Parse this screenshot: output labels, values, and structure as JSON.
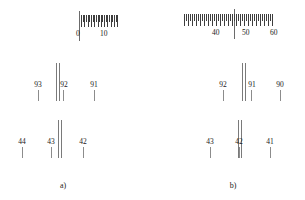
{
  "figure": {
    "groups": [
      {
        "caption": "a)",
        "scale": {
          "labels": [
            {
              "text": "0",
              "x": 62
            },
            {
              "text": "10",
              "x": 88
            }
          ],
          "divider_x": 62,
          "tick_start": 64,
          "tick_count": 23,
          "tick_spacing": 1.65
        },
        "mid": {
          "index_lines": [
            46,
            48.5
          ],
          "readings": [
            {
              "text": "93",
              "x": 28
            },
            {
              "text": "92",
              "x": 53
            },
            {
              "text": "91",
              "x": 84
            }
          ]
        },
        "bot": {
          "index_lines": [
            48,
            50.5
          ],
          "readings": [
            {
              "text": "44",
              "x": 12
            },
            {
              "text": "43",
              "x": 41
            },
            {
              "text": "42",
              "x": 73
            }
          ]
        }
      },
      {
        "caption": "b)",
        "scale": {
          "labels": [
            {
              "text": "40",
              "x": 38
            },
            {
              "text": "50",
              "x": 68
            },
            {
              "text": "60",
              "x": 96
            }
          ],
          "divider_x": 56,
          "tick_start": 6,
          "tick_count": 45,
          "tick_spacing": 2.0
        },
        "mid": {
          "index_lines": [
            57,
            59.5
          ],
          "readings": [
            {
              "text": "92",
              "x": 38
            },
            {
              "text": "91",
              "x": 66
            },
            {
              "text": "90",
              "x": 95
            }
          ]
        },
        "bot": {
          "index_lines": [
            53,
            55.5
          ],
          "readings": [
            {
              "text": "43",
              "x": 25
            },
            {
              "text": "42",
              "x": 54
            },
            {
              "text": "41",
              "x": 85
            }
          ]
        }
      }
    ]
  },
  "colors": {
    "panel_border": "#4a4a4a",
    "tick": "#3d3d3d",
    "index_line": "#7a7a7a",
    "leader": "#8c8c8c",
    "background": "#ffffff",
    "text": "#1a1a1a"
  },
  "chart_data": {
    "type": "table",
    "title": "",
    "panels": [
      {
        "group": "a)",
        "panel": "scale",
        "tick_labels": [
          "0",
          "10"
        ],
        "graduated_range": [
          0,
          10
        ],
        "notes": "graduated ticks occupy right half of panel, index divider at the 0 mark"
      },
      {
        "group": "a)",
        "panel": "middle",
        "readings": [
          93,
          92,
          91
        ],
        "index_position_between": [
          93,
          92
        ]
      },
      {
        "group": "a)",
        "panel": "bottom",
        "readings": [
          44,
          43,
          42
        ],
        "index_position_between": [
          43,
          42
        ]
      },
      {
        "group": "b)",
        "panel": "scale",
        "tick_labels": [
          "40",
          "50",
          "60"
        ],
        "graduated_range": [
          40,
          60
        ],
        "notes": "graduated ticks span full panel width, index divider near the 50 mark"
      },
      {
        "group": "b)",
        "panel": "middle",
        "readings": [
          92,
          91,
          90
        ],
        "index_position_between": [
          92,
          91
        ]
      },
      {
        "group": "b)",
        "panel": "bottom",
        "readings": [
          43,
          42,
          41
        ],
        "index_position_at": [
          42
        ]
      }
    ]
  }
}
